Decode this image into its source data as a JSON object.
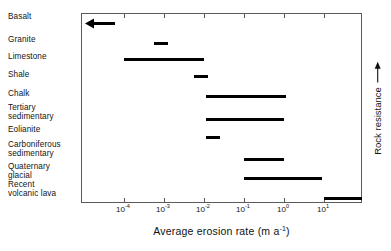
{
  "chart_data": {
    "type": "bar",
    "orientation": "horizontal",
    "title": "",
    "xlabel": "Average erosion rate  (m a-1)",
    "xlabel_parts": {
      "text": "Average erosion rate  (m a",
      "sup": "-1",
      "tail": ")"
    },
    "ylabel": "",
    "right_axis_label": "Rock resistance",
    "right_axis_arrow": "up-arrow",
    "xscale": "log",
    "xlim": [
      -4.95,
      2.0
    ],
    "grid": false,
    "legend": null,
    "xticks": [
      {
        "label_base": "10",
        "label_exp": "-4",
        "value": 0.0001
      },
      {
        "label_base": "10",
        "label_exp": "-3",
        "value": 0.001
      },
      {
        "label_base": "10",
        "label_exp": "-2",
        "value": 0.01
      },
      {
        "label_base": "10",
        "label_exp": "-1",
        "value": 0.1
      },
      {
        "label_base": "10",
        "label_exp": "0",
        "value": 1
      },
      {
        "label_base": "10",
        "label_exp": "1",
        "value": 10
      }
    ],
    "categories": [
      "Basalt",
      "Granite",
      "Limestone",
      "Shale",
      "Chalk",
      "Tertiary\nsedimentary",
      "Eolianite",
      "Carboniferous\nsedimentary",
      "Quaternary\n glacial",
      "Recent\nvolcanic lava"
    ],
    "bars": [
      {
        "name": "Basalt",
        "log_start": -4.95,
        "log_end": -4.25,
        "arrow": "left",
        "note": "off-scale to left"
      },
      {
        "name": "Granite",
        "log_start": -3.25,
        "log_end": -2.9,
        "arrow": null
      },
      {
        "name": "Limestone",
        "log_start": -4.0,
        "log_end": -2.0,
        "arrow": null
      },
      {
        "name": "Shale",
        "log_start": -2.25,
        "log_end": -1.9,
        "arrow": null
      },
      {
        "name": "Chalk",
        "log_start": -1.95,
        "log_end": 0.05,
        "arrow": null
      },
      {
        "name": "Tertiary sedimentary",
        "log_start": -1.95,
        "log_end": 0.0,
        "arrow": null
      },
      {
        "name": "Eolianite",
        "log_start": -1.95,
        "log_end": -1.6,
        "arrow": null
      },
      {
        "name": "Carboniferous sedimentary",
        "log_start": -1.0,
        "log_end": 0.0,
        "arrow": null
      },
      {
        "name": "Quaternary glacial",
        "log_start": -1.0,
        "log_end": 0.95,
        "arrow": null
      },
      {
        "name": "Recent volcanic lava",
        "log_start": 1.0,
        "log_end": 1.95,
        "arrow": null
      }
    ],
    "colors": {
      "bar": "#000000",
      "frame": "#5a5a5a",
      "text": "#111111",
      "background": "#ffffff"
    }
  },
  "labels": {
    "cat_0": "Basalt",
    "cat_1": "Granite",
    "cat_2": "Limestone",
    "cat_3": "Shale",
    "cat_4": "Chalk",
    "cat_5": "Tertiary\nsedimentary",
    "cat_6": "Eolianite",
    "cat_7": "Carboniferous\nsedimentary",
    "cat_8": "Quaternary\n glacial",
    "cat_9": "Recent\nvolcanic lava",
    "rock_resistance": "Rock resistance",
    "xaxis_main": "Average erosion rate  (m a",
    "xaxis_sup": "-1",
    "xaxis_tail": ")"
  }
}
